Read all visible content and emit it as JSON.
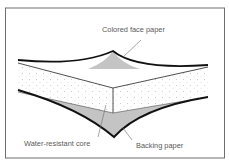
{
  "diagram": {
    "labels": {
      "face_paper": "Colored face paper",
      "core": "Water-resistant core",
      "backing_paper": "Backing paper"
    },
    "colors": {
      "frame": "#6e6e6e",
      "outline": "#111111",
      "paper_fill": "#c4c4c4",
      "core_fill": "#ffffff",
      "core_dots": "#9a9a9a",
      "label_text": "#5a5a5a",
      "leader_line": "#6a6a6a"
    }
  }
}
